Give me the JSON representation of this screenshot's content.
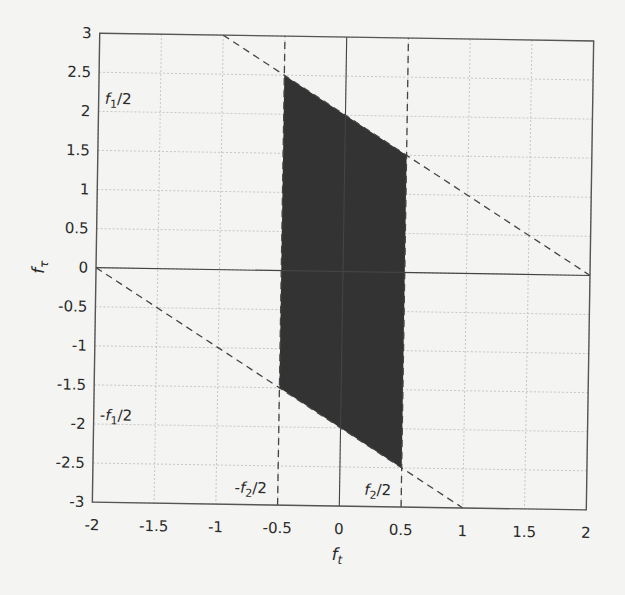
{
  "chart_data": {
    "type": "area",
    "title": "",
    "xlabel": "f_t",
    "ylabel": "f_τ",
    "xlim": [
      -2,
      2
    ],
    "ylim": [
      -3,
      3
    ],
    "grid": true,
    "x_ticks": [
      "-2",
      "-1.5",
      "-1",
      "-0.5",
      "0",
      "0.5",
      "1",
      "1.5",
      "2"
    ],
    "y_ticks": [
      "3",
      "2.5",
      "2",
      "1.5",
      "1",
      "0.5",
      "0",
      "-0.5",
      "-1",
      "-1.5",
      "-2",
      "-2.5",
      "-3"
    ],
    "shaded_region": {
      "color": "#333333",
      "vertices": [
        [
          -0.5,
          2.5
        ],
        [
          0.5,
          1.5
        ],
        [
          0.5,
          -2.5
        ],
        [
          -0.5,
          -1.5
        ]
      ]
    },
    "dashed_lines": [
      {
        "name": "upper-diagonal",
        "points": [
          [
            -1,
            3
          ],
          [
            2,
            0
          ]
        ]
      },
      {
        "name": "lower-diagonal",
        "points": [
          [
            -2,
            0
          ],
          [
            1,
            -3
          ]
        ]
      },
      {
        "name": "left-vertical",
        "points": [
          [
            -0.5,
            -3
          ],
          [
            -0.5,
            3
          ]
        ]
      },
      {
        "name": "right-vertical",
        "points": [
          [
            0.5,
            -3
          ],
          [
            0.5,
            3
          ]
        ]
      }
    ],
    "solid_axes": [
      {
        "name": "x-zero",
        "points": [
          [
            -2,
            0
          ],
          [
            2,
            0
          ]
        ]
      },
      {
        "name": "y-zero",
        "points": [
          [
            0,
            -3
          ],
          [
            0,
            3
          ]
        ]
      }
    ],
    "annotations": [
      {
        "text": "f1/2",
        "main": "f",
        "sub": "1",
        "suffix": "/2",
        "prefix": "",
        "x": -1.95,
        "y": 2.1
      },
      {
        "text": "-f1/2",
        "main": "f",
        "sub": "1",
        "suffix": "/2",
        "prefix": "-",
        "x": -1.95,
        "y": -1.95
      },
      {
        "text": "-f2/2",
        "main": "f",
        "sub": "2",
        "suffix": "/2",
        "prefix": "-",
        "x": -0.85,
        "y": -2.85
      },
      {
        "text": "f2/2",
        "main": "f",
        "sub": "2",
        "suffix": "/2",
        "prefix": "",
        "x": 0.2,
        "y": -2.85
      }
    ]
  },
  "labels": {
    "x_main": "f",
    "x_sub": "t",
    "y_main": "f",
    "y_sub": "τ"
  }
}
